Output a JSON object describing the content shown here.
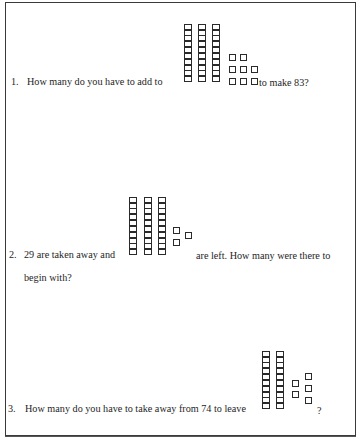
{
  "worksheet": {
    "questions": [
      {
        "number": "1.",
        "text_before": "How many do you have to add to",
        "text_after": "to make 83?",
        "blocks": {
          "tens": 3,
          "ones": 8,
          "value": 38
        }
      },
      {
        "number": "2.",
        "text_before": "29 are taken away and",
        "text_after": "are left.  How many were there to",
        "text_line2": "begin with?",
        "blocks": {
          "tens": 3,
          "ones": 3,
          "value": 33
        }
      },
      {
        "number": "3.",
        "text_before": "How many do you have to take away from 74 to leave",
        "text_after": "?",
        "blocks": {
          "tens": 2,
          "ones": 5,
          "value": 25
        }
      }
    ]
  }
}
